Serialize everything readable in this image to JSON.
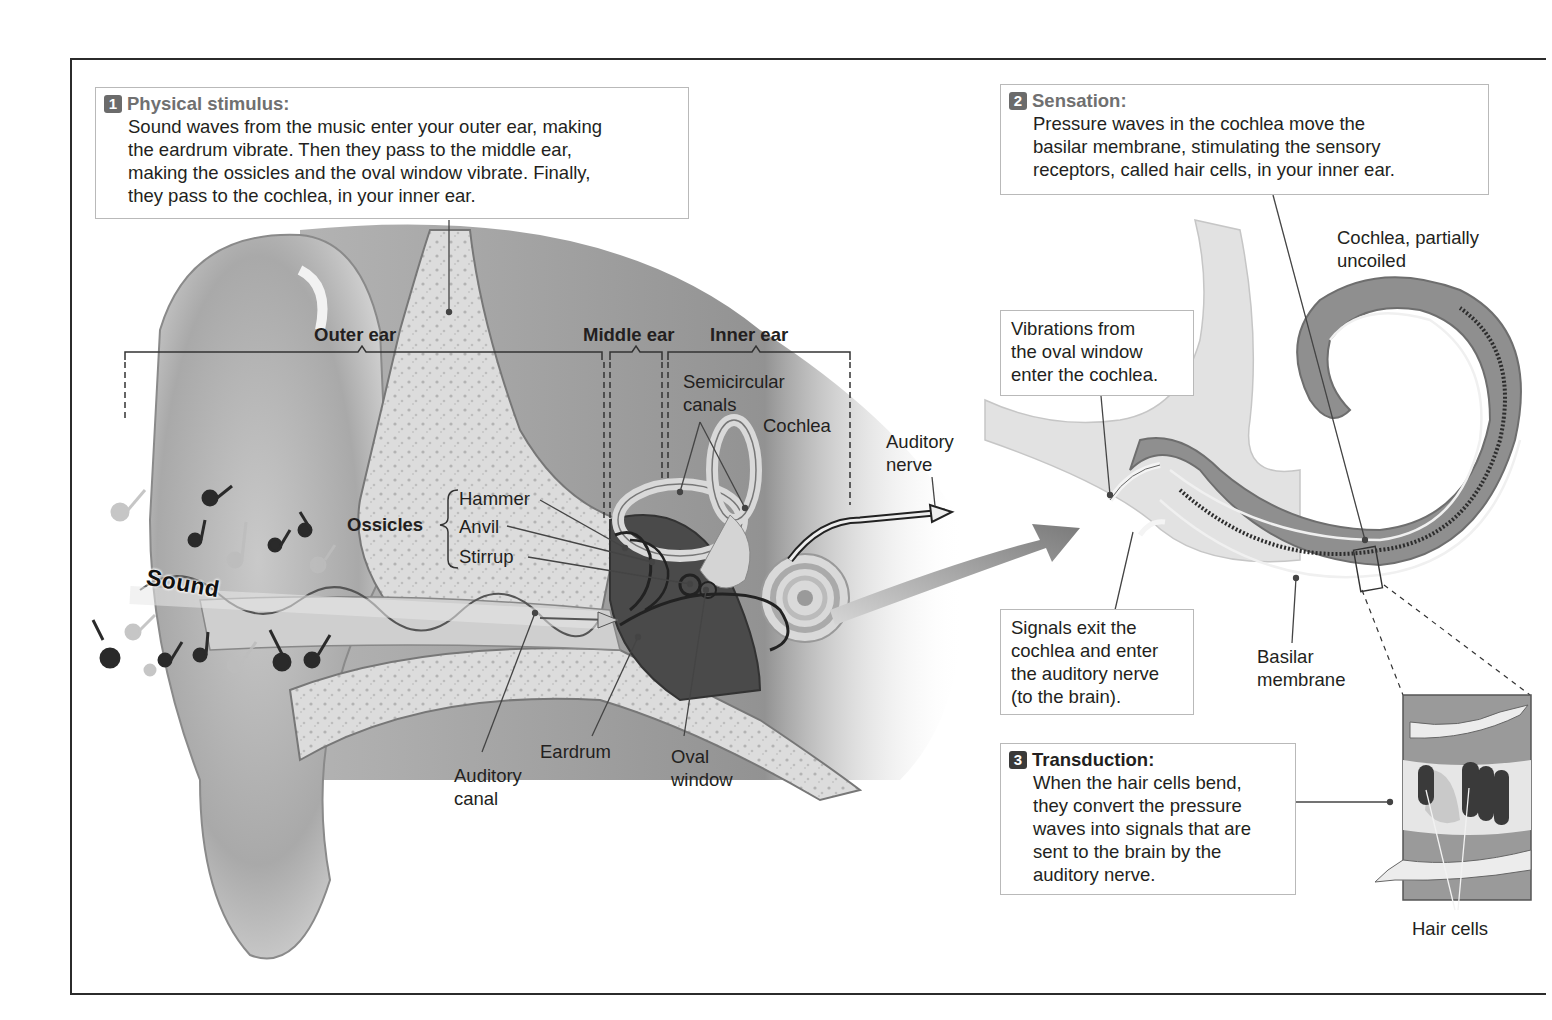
{
  "figure": {
    "steps": [
      {
        "number": "1",
        "heading": "Physical stimulus:",
        "lines": [
          "Sound waves from the music enter your outer ear, making",
          "the eardrum vibrate. Then they pass to the middle ear,",
          "making the ossicles and the oval window vibrate. Finally,",
          "they pass to the cochlea, in your inner ear."
        ]
      },
      {
        "number": "2",
        "heading": "Sensation:",
        "lines": [
          "Pressure waves in the cochlea move the",
          "basilar membrane, stimulating the sensory",
          "receptors, called hair cells, in your inner ear."
        ]
      },
      {
        "number": "3",
        "heading": "Transduction:",
        "lines": [
          "When the hair cells bend,",
          "they convert the pressure",
          "waves into signals that are",
          "sent to the brain by the",
          "auditory nerve."
        ]
      }
    ],
    "callouts": {
      "vibrations": [
        "Vibrations from",
        "the oval window",
        "enter the cochlea."
      ],
      "signals": [
        "Signals exit the",
        "cochlea and enter",
        "the auditory nerve",
        "(to the brain)."
      ]
    },
    "region_labels": {
      "outer_ear": "Outer ear",
      "middle_ear": "Middle ear",
      "inner_ear": "Inner ear"
    },
    "anatomy_labels": {
      "semicircular_canals": [
        "Semicircular",
        "canals"
      ],
      "cochlea": "Cochlea",
      "auditory_nerve": [
        "Auditory",
        "nerve"
      ],
      "ossicles": "Ossicles",
      "hammer": "Hammer",
      "anvil": "Anvil",
      "stirrup": "Stirrup",
      "sound": "Sound",
      "auditory_canal": [
        "Auditory",
        "canal"
      ],
      "eardrum": "Eardrum",
      "oval_window": [
        "Oval",
        "window"
      ],
      "cochlea_uncoiled": [
        "Cochlea, partially",
        "uncoiled"
      ],
      "basilar_membrane": [
        "Basilar",
        "membrane"
      ],
      "hair_cells": "Hair cells"
    },
    "colors": {
      "frame": "#2b2b2b",
      "box_border": "#b9b9b9",
      "step_badge": "#6b6b6b",
      "step_heading": "#707070",
      "cochlea_fill": "#8f8f8f",
      "tissue_light": "#d8d8d8",
      "arrow": "#8a8a8a"
    }
  }
}
